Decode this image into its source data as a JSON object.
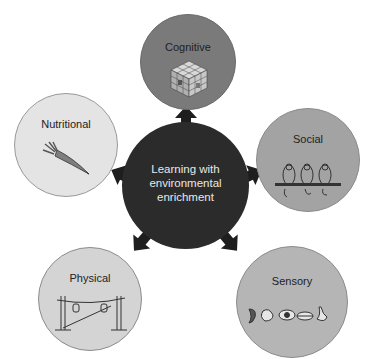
{
  "diagram": {
    "center": {
      "label_lines": [
        "Learning with",
        "environmental",
        "enrichment"
      ],
      "color": "#2b2b2b"
    },
    "nodes": [
      {
        "id": "cognitive",
        "label": "Cognitive",
        "icon": "rubiks-cube-icon",
        "color": "#7a7a7a"
      },
      {
        "id": "social",
        "label": "Social",
        "icon": "birds-on-perch-icon",
        "color": "#a3a3a3"
      },
      {
        "id": "sensory",
        "label": "Sensory",
        "icon": "sense-organs-icon",
        "color": "#b5b5b5"
      },
      {
        "id": "physical",
        "label": "Physical",
        "icon": "rope-swing-icon",
        "color": "#d4d4d4"
      },
      {
        "id": "nutritional",
        "label": "Nutritional",
        "icon": "carrot-icon",
        "color": "#e4e4e4"
      }
    ],
    "arrow_color": "#1e1e1e"
  }
}
